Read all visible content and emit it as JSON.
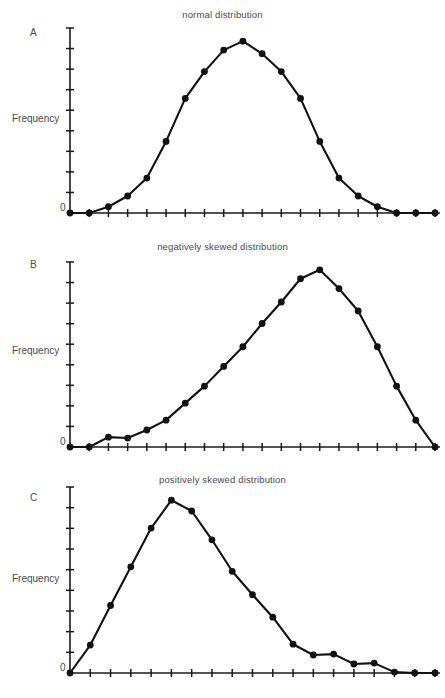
{
  "figure": {
    "axis_label": "Frequency",
    "zero_label": "0",
    "header_fragment": "",
    "line_color": "#111111",
    "axis_color": "#1a1a1a",
    "text_color": "#4a4a4a",
    "background": "#ffffff"
  },
  "panels": [
    {
      "letter": "A",
      "title": "normal distribution"
    },
    {
      "letter": "B",
      "title": "negatively skewed distribution"
    },
    {
      "letter": "C",
      "title": "positively skewed distribution"
    }
  ],
  "chart_data": [
    {
      "type": "line",
      "title": "normal distribution",
      "panel": "A",
      "xlabel": "",
      "ylabel": "Frequency",
      "ylim": [
        0,
        10
      ],
      "xlim": [
        0,
        19
      ],
      "grid": false,
      "legend": "none",
      "yticks": 8,
      "xticks": 19,
      "x": [
        0,
        1,
        2,
        3,
        4,
        5,
        6,
        7,
        8,
        9,
        10,
        11,
        12,
        13,
        14,
        15,
        16,
        17,
        18,
        19
      ],
      "values": [
        0,
        0,
        0.35,
        0.95,
        1.95,
        4.0,
        6.4,
        7.9,
        9.1,
        9.6,
        8.9,
        7.9,
        6.4,
        4.0,
        1.95,
        0.95,
        0.35,
        0,
        0,
        0
      ],
      "series": [
        {
          "name": "normal distribution",
          "values": [
            0,
            0,
            0.35,
            0.95,
            1.95,
            4.0,
            6.4,
            7.9,
            9.1,
            9.6,
            8.9,
            7.9,
            6.4,
            4.0,
            1.95,
            0.95,
            0.35,
            0,
            0,
            0
          ]
        }
      ]
    },
    {
      "type": "line",
      "title": "negatively skewed distribution",
      "panel": "B",
      "xlabel": "",
      "ylabel": "Frequency",
      "ylim": [
        0,
        10
      ],
      "xlim": [
        0,
        19
      ],
      "grid": false,
      "legend": "none",
      "yticks": 8,
      "xticks": 19,
      "x": [
        0,
        1,
        2,
        3,
        4,
        5,
        6,
        7,
        8,
        9,
        10,
        11,
        12,
        13,
        14,
        15,
        16,
        17,
        18,
        19
      ],
      "values": [
        0,
        0,
        0.55,
        0.5,
        0.95,
        1.5,
        2.45,
        3.4,
        4.5,
        5.6,
        6.9,
        8.1,
        9.4,
        9.9,
        8.85,
        7.6,
        5.6,
        3.4,
        1.5,
        0
      ],
      "series": [
        {
          "name": "negatively skewed distribution",
          "values": [
            0,
            0,
            0.55,
            0.5,
            0.95,
            1.5,
            2.45,
            3.4,
            4.5,
            5.6,
            6.9,
            8.1,
            9.4,
            9.9,
            8.85,
            7.6,
            5.6,
            3.4,
            1.5,
            0
          ]
        }
      ]
    },
    {
      "type": "line",
      "title": "positively skewed distribution",
      "panel": "C",
      "xlabel": "",
      "ylabel": "Frequency",
      "ylim": [
        0,
        10
      ],
      "xlim": [
        0,
        18
      ],
      "grid": false,
      "legend": "none",
      "yticks": 8,
      "xticks": 18,
      "x": [
        0,
        1,
        2,
        3,
        4,
        5,
        6,
        7,
        8,
        9,
        10,
        11,
        12,
        13,
        14,
        15,
        16,
        17,
        18
      ],
      "values": [
        0,
        1.55,
        3.75,
        5.9,
        8.05,
        9.6,
        9.0,
        7.4,
        5.65,
        4.35,
        3.1,
        1.6,
        1.0,
        1.05,
        0.5,
        0.55,
        0.05,
        0,
        0
      ],
      "series": [
        {
          "name": "positively skewed distribution",
          "values": [
            0,
            1.55,
            3.75,
            5.9,
            8.05,
            9.6,
            9.0,
            7.4,
            5.65,
            4.35,
            3.1,
            1.6,
            1.0,
            1.05,
            0.5,
            0.55,
            0.05,
            0,
            0
          ]
        }
      ]
    }
  ]
}
